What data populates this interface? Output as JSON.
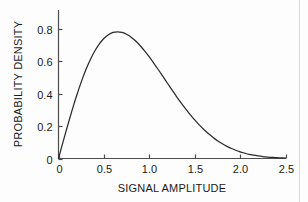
{
  "chart_data": {
    "type": "line",
    "title": "",
    "xlabel": "SIGNAL AMPLITUDE",
    "ylabel": "PROBABILITY DENSITY",
    "xlim": [
      0,
      2.5
    ],
    "ylim": [
      0,
      0.9
    ],
    "grid": false,
    "legend": null,
    "xticks": [
      0,
      0.5,
      1.0,
      1.5,
      2.0,
      2.5
    ],
    "xtick_labels": [
      "0",
      "0.5",
      "1.0",
      "1.5",
      "2.0",
      "2.5"
    ],
    "yticks": [
      0,
      0.2,
      0.4,
      0.6,
      0.8
    ],
    "ytick_labels": [
      "0",
      "0.2",
      "0.4",
      "0.6",
      "0.8"
    ],
    "series": [
      {
        "name": "Rayleigh probability density",
        "color": "#2b2b2b",
        "x": [
          0.0,
          0.05,
          0.1,
          0.15,
          0.2,
          0.25,
          0.3,
          0.35,
          0.4,
          0.45,
          0.5,
          0.55,
          0.6,
          0.65,
          0.7,
          0.75,
          0.8,
          0.85,
          0.9,
          0.95,
          1.0,
          1.05,
          1.1,
          1.15,
          1.2,
          1.25,
          1.3,
          1.35,
          1.4,
          1.45,
          1.5,
          1.55,
          1.6,
          1.65,
          1.7,
          1.75,
          1.8,
          1.85,
          1.9,
          1.95,
          2.0,
          2.05,
          2.1,
          2.15,
          2.2,
          2.25,
          2.3,
          2.35,
          2.4,
          2.45,
          2.5
        ],
        "y": [
          0.0,
          0.102,
          0.202,
          0.298,
          0.388,
          0.471,
          0.545,
          0.609,
          0.663,
          0.707,
          0.74,
          0.763,
          0.777,
          0.781,
          0.777,
          0.766,
          0.748,
          0.724,
          0.695,
          0.662,
          0.626,
          0.587,
          0.547,
          0.506,
          0.464,
          0.423,
          0.382,
          0.343,
          0.306,
          0.271,
          0.238,
          0.207,
          0.179,
          0.154,
          0.131,
          0.11,
          0.092,
          0.076,
          0.063,
          0.051,
          0.041,
          0.033,
          0.026,
          0.021,
          0.016,
          0.012,
          0.009,
          0.007,
          0.005,
          0.004,
          0.003
        ]
      }
    ],
    "peak": {
      "x": 0.71,
      "y": 0.86
    }
  },
  "axes": {
    "x_title": "SIGNAL AMPLITUDE",
    "y_title": "PROBABILITY DENSITY"
  }
}
